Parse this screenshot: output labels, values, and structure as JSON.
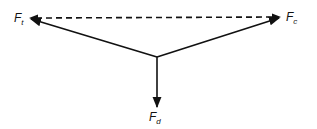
{
  "diagram": {
    "type": "force-vector-diagram",
    "colors": {
      "stroke": "#111111",
      "background": "#ffffff"
    },
    "nodes": {
      "origin": {
        "x": 157,
        "y": 57
      },
      "ft_tip": {
        "x": 29,
        "y": 18
      },
      "fc_tip": {
        "x": 281,
        "y": 17
      },
      "fd_tip": {
        "x": 157,
        "y": 108
      }
    },
    "labels": {
      "ft": {
        "main": "F",
        "sub": "t"
      },
      "fc": {
        "main": "F",
        "sub": "c"
      },
      "fd": {
        "main": "F",
        "sub": "d"
      }
    },
    "edges": [
      {
        "from": "origin",
        "to": "ft_tip",
        "style": "solid",
        "arrow": "end"
      },
      {
        "from": "origin",
        "to": "fc_tip",
        "style": "solid",
        "arrow": "end"
      },
      {
        "from": "origin",
        "to": "fd_tip",
        "style": "solid",
        "arrow": "end"
      },
      {
        "from": "fc_tip",
        "to": "ft_tip",
        "style": "dashed",
        "arrow": "both"
      }
    ]
  }
}
